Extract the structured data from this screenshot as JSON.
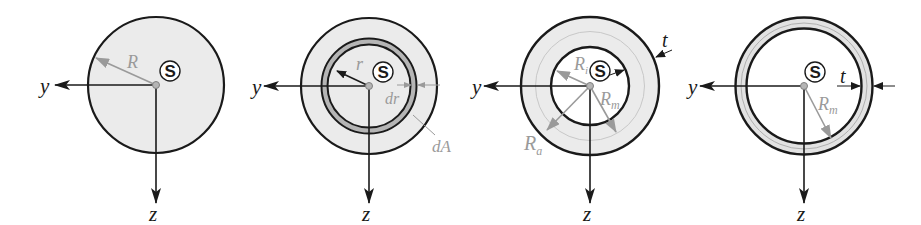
{
  "figure": {
    "colors": {
      "outline": "#1a1a1a",
      "fill": "#ebebeb",
      "dim_gray": "#9a9a9a",
      "ring_gray": "#b5b5b5",
      "background": "#ffffff"
    }
  },
  "panels": [
    {
      "id": "solid-circle",
      "labels": {
        "y": "y",
        "z": "z",
        "centroid": "S",
        "radius": "R"
      }
    },
    {
      "id": "circle-with-ring-element",
      "labels": {
        "y": "y",
        "z": "z",
        "centroid": "S",
        "radius": "r",
        "dr": "dr",
        "dA": "dA"
      }
    },
    {
      "id": "thick-walled-tube",
      "labels": {
        "y": "y",
        "z": "z",
        "centroid": "S",
        "inner_radius": "R",
        "inner_sub": "i",
        "mean_radius": "R",
        "mean_sub": "m",
        "outer_radius": "R",
        "outer_sub": "a",
        "thickness": "t"
      }
    },
    {
      "id": "thin-walled-tube",
      "labels": {
        "y": "y",
        "z": "z",
        "centroid": "S",
        "mean_radius": "R",
        "mean_sub": "m",
        "thickness": "t"
      }
    }
  ]
}
